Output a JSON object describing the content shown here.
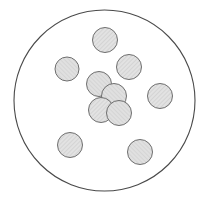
{
  "diagram": {
    "canvas": {
      "width": 213,
      "height": 202,
      "background": "#ffffff"
    },
    "style": {
      "container_stroke": "#4a4a4a",
      "container_stroke_width": 1.1,
      "container_fill": "none",
      "circle_fill": "#dedede",
      "circle_stroke": "#6e6e6e",
      "circle_stroke_width": 1.0,
      "hatch_color": "#bdbdbd",
      "hatch_spacing": 2
    },
    "container": {
      "name": "boundary-circle",
      "cx": 104.5,
      "cy": 100.5,
      "r": 90.5
    },
    "circle_count": 10,
    "circles": [
      {
        "id": "circle-1",
        "group": "scatter",
        "cx": 105,
        "cy": 40,
        "r": 12.5
      },
      {
        "id": "circle-2",
        "group": "scatter",
        "cx": 67,
        "cy": 69,
        "r": 12.0
      },
      {
        "id": "circle-3",
        "group": "scatter",
        "cx": 129,
        "cy": 67,
        "r": 12.5
      },
      {
        "id": "circle-4",
        "group": "cluster",
        "cx": 99,
        "cy": 84,
        "r": 12.5
      },
      {
        "id": "circle-5",
        "group": "scatter",
        "cx": 160,
        "cy": 96,
        "r": 12.5
      },
      {
        "id": "circle-6",
        "group": "cluster",
        "cx": 114,
        "cy": 96,
        "r": 12.5
      },
      {
        "id": "circle-7",
        "group": "cluster",
        "cx": 101,
        "cy": 110,
        "r": 12.5
      },
      {
        "id": "circle-8",
        "group": "cluster",
        "cx": 119,
        "cy": 113,
        "r": 12.5
      },
      {
        "id": "circle-9",
        "group": "scatter",
        "cx": 70,
        "cy": 145,
        "r": 12.5
      },
      {
        "id": "circle-10",
        "group": "scatter",
        "cx": 140,
        "cy": 152,
        "r": 12.5
      }
    ]
  },
  "chart_data": {
    "type": "scatter",
    "title": "",
    "xlabel": "",
    "ylabel": "",
    "xlim": [
      14,
      195
    ],
    "ylim": [
      10,
      191
    ],
    "grid": false,
    "legend": null,
    "annotations": [],
    "series": [
      {
        "name": "packed-circles",
        "marker": "circle",
        "x": [
          105,
          67,
          129,
          99,
          160,
          114,
          101,
          119,
          70,
          140
        ],
        "y": [
          40,
          69,
          67,
          84,
          96,
          96,
          110,
          113,
          145,
          152
        ],
        "r": [
          12.5,
          12.0,
          12.5,
          12.5,
          12.5,
          12.5,
          12.5,
          12.5,
          12.5,
          12.5
        ]
      }
    ],
    "boundary": {
      "cx": 104.5,
      "cy": 100.5,
      "r": 90.5
    }
  }
}
